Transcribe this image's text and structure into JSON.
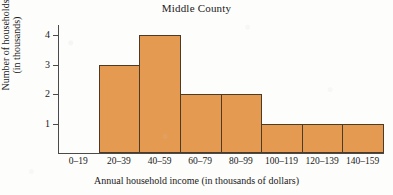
{
  "chart_data": {
    "type": "bar",
    "title": "Middle County",
    "xlabel": "Annual household income (in thousands of dollars)",
    "ylabel": "Number of households (in thousands)",
    "ylabel_lines": [
      "Number of households",
      "(in thousands)"
    ],
    "categories": [
      "0–19",
      "20–39",
      "40–59",
      "60–79",
      "80–99",
      "100–119",
      "120–139",
      "140–159"
    ],
    "values": [
      0,
      3,
      4,
      2,
      2,
      1,
      1,
      1
    ],
    "yticks": [
      1,
      2,
      3,
      4
    ],
    "ytick_labels": [
      "1",
      "2",
      "3",
      "4"
    ],
    "ylim": [
      0,
      4.35
    ],
    "grid": false,
    "legend": null,
    "bar_fill_color": "#e59a52",
    "bar_edge_color": "#4d3b26",
    "axis_color": "#4a4a4a",
    "background_color": "#fdfdfc"
  }
}
